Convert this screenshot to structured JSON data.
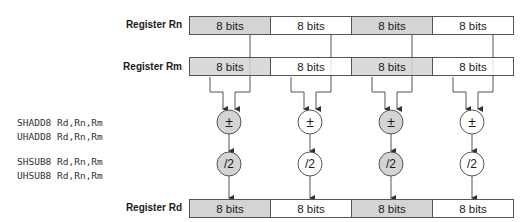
{
  "registers": {
    "rn": {
      "label": "Register Rn",
      "cells": [
        "8 bits",
        "8 bits",
        "8 bits",
        "8 bits"
      ]
    },
    "rm": {
      "label": "Register Rm",
      "cells": [
        "8 bits",
        "8 bits",
        "8 bits",
        "8 bits"
      ]
    },
    "rd": {
      "label": "Register Rd",
      "cells": [
        "8 bits",
        "8 bits",
        "8 bits",
        "8 bits"
      ]
    }
  },
  "shaded_lanes": [
    0,
    2
  ],
  "operations": {
    "add_sub_symbol": "±",
    "halve_symbol": "/2"
  },
  "instructions": {
    "group1": [
      "SHADD8 Rd,Rn,Rm",
      "UHADD8 Rd,Rn,Rm"
    ],
    "group2": [
      "SHSUB8 Rd,Rn,Rm",
      "UHSUB8 Rd,Rn,Rm"
    ]
  },
  "colors": {
    "shaded_fill": "#d4d4d4",
    "line": "#555555"
  }
}
